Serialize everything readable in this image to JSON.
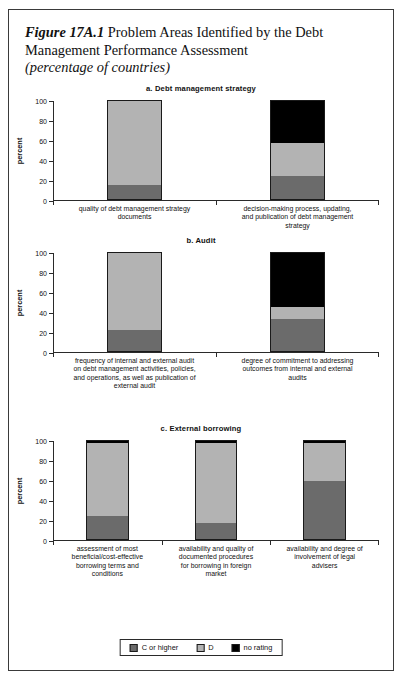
{
  "figure": {
    "number": "Figure 17A.1",
    "title_main": "Problem Areas Identified by the Debt Management Performance Assessment",
    "subtitle": "(percentage of countries)"
  },
  "colors": {
    "c_or_higher": "#6b6b6b",
    "d": "#b3b3b3",
    "no_rating": "#000000",
    "axis": "#2a2a2a",
    "frame": "#3a3a3a"
  },
  "legend": {
    "items": [
      {
        "label": "C or higher",
        "color": "#6b6b6b",
        "swatch_name": "legend-swatch-c-or-higher"
      },
      {
        "label": "D",
        "color": "#b3b3b3",
        "swatch_name": "legend-swatch-d"
      },
      {
        "label": "no rating",
        "color": "#000000",
        "swatch_name": "legend-swatch-no-rating"
      }
    ]
  },
  "chart_data": [
    {
      "type": "bar",
      "stacked": true,
      "panel": "a",
      "title": "a. Debt management strategy",
      "xlabel": "",
      "ylabel": "percent",
      "ylim": [
        0,
        100
      ],
      "yticks": [
        0,
        20,
        40,
        60,
        80,
        100
      ],
      "ytick_labels": [
        "0",
        "20",
        "40",
        "60",
        "80",
        "100"
      ],
      "grid": false,
      "legend_position": "bottom-figure",
      "categories": [
        "quality of debt management strategy documents",
        "decision-making process, updating, and publication of debt management strategy"
      ],
      "series": [
        {
          "name": "C or higher",
          "values": [
            15,
            24
          ],
          "color": "#6b6b6b"
        },
        {
          "name": "D",
          "values": [
            85,
            33
          ],
          "color": "#b3b3b3"
        },
        {
          "name": "no rating",
          "values": [
            0,
            43
          ],
          "color": "#000000"
        }
      ]
    },
    {
      "type": "bar",
      "stacked": true,
      "panel": "b",
      "title": "b. Audit",
      "xlabel": "",
      "ylabel": "percent",
      "ylim": [
        0,
        100
      ],
      "yticks": [
        0,
        20,
        40,
        60,
        80,
        100
      ],
      "ytick_labels": [
        "0",
        "20",
        "40",
        "60",
        "80",
        "100"
      ],
      "grid": false,
      "legend_position": "bottom-figure",
      "categories": [
        "frequency of internal and external audit on debt management activities, policies, and operations, as well as publication of external audit",
        "degree of commitment to addressing outcomes from internal and external audits"
      ],
      "series": [
        {
          "name": "C or higher",
          "values": [
            22,
            33
          ],
          "color": "#6b6b6b"
        },
        {
          "name": "D",
          "values": [
            78,
            12
          ],
          "color": "#b3b3b3"
        },
        {
          "name": "no rating",
          "values": [
            0,
            55
          ],
          "color": "#000000"
        }
      ]
    },
    {
      "type": "bar",
      "stacked": true,
      "panel": "c",
      "title": "c. External borrowing",
      "xlabel": "",
      "ylabel": "percent",
      "ylim": [
        0,
        100
      ],
      "yticks": [
        0,
        20,
        40,
        60,
        80,
        100
      ],
      "ytick_labels": [
        "0",
        "20",
        "40",
        "60",
        "80",
        "100"
      ],
      "grid": false,
      "legend_position": "bottom-figure",
      "categories": [
        "assessment of most beneficial/cost-effective borrowing terms and conditions",
        "availability and quality of documented procedures for borrowing in foreign market",
        "availability and degree of involvement of legal advisers"
      ],
      "series": [
        {
          "name": "C or higher",
          "values": [
            24,
            17,
            59
          ],
          "color": "#6b6b6b"
        },
        {
          "name": "D",
          "values": [
            73,
            80,
            38
          ],
          "color": "#b3b3b3"
        },
        {
          "name": "no rating",
          "values": [
            3,
            3,
            3
          ],
          "color": "#000000"
        }
      ]
    }
  ]
}
